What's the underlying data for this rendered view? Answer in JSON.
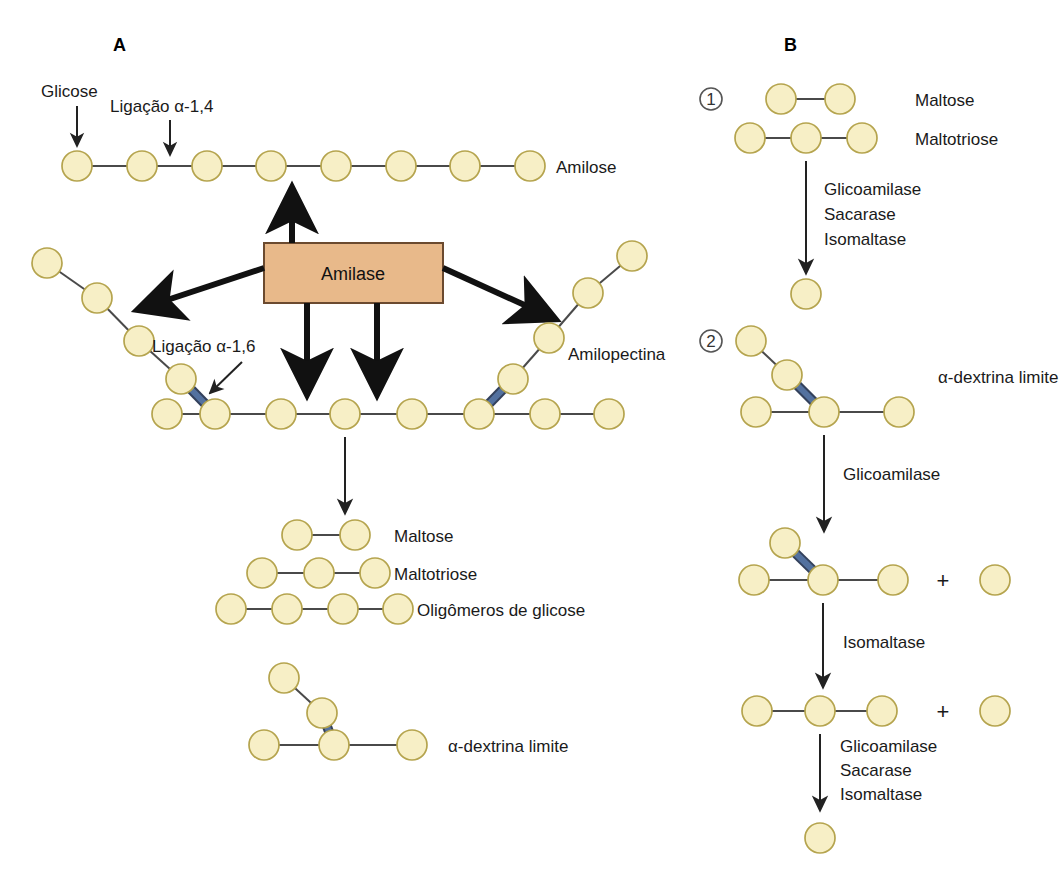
{
  "figure": {
    "background_color": "#ffffff",
    "glucose_circle": {
      "fill": "#f7efc6",
      "stroke": "#b5a44e",
      "radius": 15
    },
    "bond_alpha14": {
      "color": "#4a4a4a",
      "label": "alpha-1,4 glycosidic bond"
    },
    "bond_alpha16": {
      "color": "#53719f",
      "stroke": "#33415c",
      "label": "alpha-1,6 glycosidic bond"
    },
    "arrow_color": "#111111"
  },
  "panels": {
    "a": {
      "letter": "A",
      "labels": {
        "glicose": "Glicose",
        "ligacao_14": "Ligação α-1,4",
        "ligacao_16": "Ligação α-1,6",
        "amilose": "Amilose",
        "amilopectina": "Amilopectina",
        "enzyme_box": "Amilase",
        "maltose": "Maltose",
        "maltotriose": "Maltotriose",
        "oligomeros": "Oligômeros de glicose",
        "alpha_dextrina": "α-dextrina limite"
      },
      "enzyme_box_color": {
        "fill": "#e8b98a",
        "stroke": "#6b4a2f"
      },
      "structures": {
        "amilose_units": 8,
        "amilopectina_backbone_units": 8,
        "amilopectina_branches": 2,
        "maltose_units": 2,
        "maltotriose_units": 3,
        "oligomeros_units": 4,
        "alpha_dextrina_units": 5
      }
    },
    "b": {
      "letter": "B",
      "steps": [
        {
          "number": "1",
          "substrates": [
            {
              "label": "Maltose",
              "units": 2
            },
            {
              "label": "Maltotriose",
              "units": 3
            }
          ],
          "enzymes": [
            "Glicoamilase",
            "Sacarase",
            "Isomaltase"
          ],
          "product": {
            "label": "",
            "units": 1
          }
        },
        {
          "number": "2",
          "substrates": [
            {
              "label": "α-dextrina limite",
              "units": 5
            }
          ],
          "reactions": [
            {
              "enzymes": [
                "Glicoamilase"
              ],
              "products_label": "+"
            },
            {
              "enzymes": [
                "Isomaltase"
              ],
              "products_label": "+"
            },
            {
              "enzymes": [
                "Glicoamilase",
                "Sacarase",
                "Isomaltase"
              ],
              "products_label": ""
            }
          ]
        }
      ],
      "plus_symbol": "+"
    }
  }
}
